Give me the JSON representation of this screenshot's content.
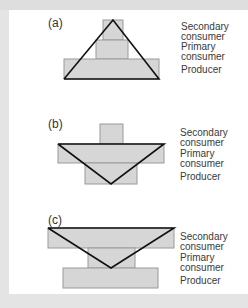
{
  "figure": {
    "colors": {
      "background": "#e4e4e4",
      "panel": "#ffffff",
      "block_fill": "#d6d6d6",
      "block_stroke": "#9a9a9a",
      "pyramid_line": "#111111",
      "label_text": "#3a3a3a"
    },
    "panels": [
      {
        "letter": "(a)",
        "labels": {
          "secondary": "Secondary consumer",
          "primary": "Primary consumer",
          "producer": "Producer"
        }
      },
      {
        "letter": "(b)",
        "labels": {
          "secondary": "Secondary consumer",
          "primary": "Primary consumer",
          "producer": "Producer"
        }
      },
      {
        "letter": "(c)",
        "labels": {
          "secondary": "Secondary consumer",
          "primary": "Primary consumer",
          "producer": "Producer"
        }
      }
    ]
  },
  "text": {
    "a_letter": "(a)",
    "b_letter": "(b)",
    "c_letter": "(c)",
    "secondary_line1": "Secondary",
    "secondary_line2": "consumer",
    "primary_line1": "Primary",
    "primary_line2": "consumer",
    "producer": "Producer"
  }
}
